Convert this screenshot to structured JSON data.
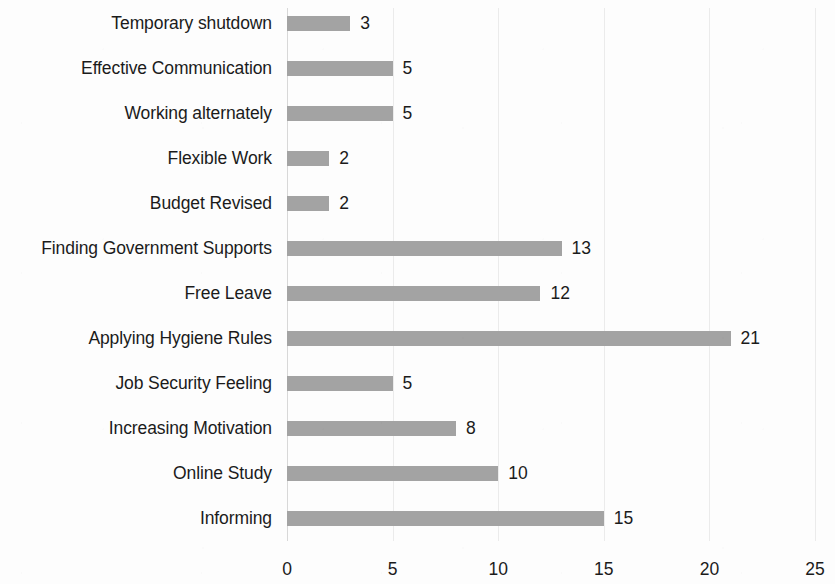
{
  "chart_data": {
    "type": "bar",
    "orientation": "horizontal",
    "title": "",
    "subtitle": "",
    "xlabel": "",
    "ylabel": "",
    "xlim": [
      0,
      25
    ],
    "x_ticks": [
      "0",
      "5",
      "10",
      "15",
      "20",
      "25"
    ],
    "x_tick_values": [
      0,
      5,
      10,
      15,
      20,
      25
    ],
    "grid": true,
    "grid_axis": "x",
    "legend": false,
    "legend_position": "none",
    "data_labels": true,
    "bar_color": "#a3a3a3",
    "text_color": "#1b1b1b",
    "gridline_color": "#ebebeb",
    "categories": [
      "Temporary shutdown",
      "Effective Communication",
      "Working alternately",
      "Flexible Work",
      "Budget Revised",
      "Finding Government Supports",
      "Free Leave",
      "Applying Hygiene Rules",
      "Job Security Feeling",
      "Increasing Motivation",
      "Online Study",
      "Informing"
    ],
    "values": [
      3,
      5,
      5,
      2,
      2,
      13,
      12,
      21,
      5,
      8,
      10,
      15
    ],
    "value_labels": [
      "3",
      "5",
      "5",
      "2",
      "2",
      "13",
      "12",
      "21",
      "5",
      "8",
      "10",
      "15"
    ]
  }
}
